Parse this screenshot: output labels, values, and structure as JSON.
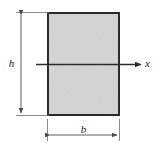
{
  "figure": {
    "kind": "cross-section-diagram",
    "background_color": "#ffffff"
  },
  "shape": {
    "name": "rectangle-cross-section",
    "fill_color": "#d4d4d4",
    "stroke_color": "#2b2b2b",
    "stroke_width": 2,
    "left": 47,
    "top": 12,
    "width": 73,
    "height": 104
  },
  "axis": {
    "name": "x-axis",
    "label": "x",
    "color": "#2b2b2b",
    "y": 64.5,
    "x_start": 36,
    "x_end": 143
  },
  "dimensions": [
    {
      "id": "height",
      "label": "h",
      "orientation": "vertical",
      "color": "#5a5a5a",
      "line_x": 21,
      "y_start": 12,
      "y_end": 116
    },
    {
      "id": "width",
      "label": "b",
      "orientation": "horizontal",
      "color": "#5a5a5a",
      "line_y": 135,
      "x_start": 47,
      "x_end": 120
    }
  ]
}
